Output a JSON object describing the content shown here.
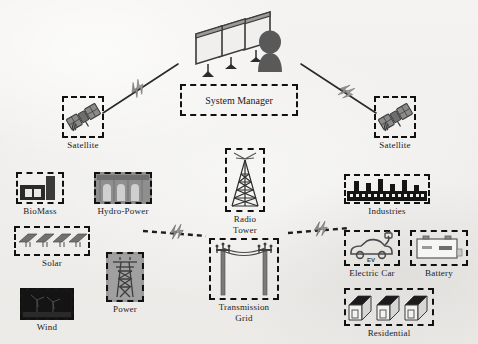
{
  "diagram": {
    "background_color": "#f2f1ef",
    "border_style": "dashed",
    "border_color": "#111111"
  },
  "nodes": {
    "system_manager": {
      "label": "System Manager",
      "icon": "monitors-operator-icon"
    },
    "satellite_left": {
      "label": "Satellite",
      "icon": "satellite-icon"
    },
    "satellite_right": {
      "label": "Satellite",
      "icon": "satellite-icon"
    },
    "biomass": {
      "label": "BioMass",
      "icon": "biomass-plant-icon"
    },
    "hydro": {
      "label": "Hydro-Power",
      "icon": "hydro-dam-icon"
    },
    "solar": {
      "label": "Solar",
      "icon": "solar-panels-icon"
    },
    "wind": {
      "label": "Wind",
      "icon": "wind-turbines-icon"
    },
    "power": {
      "label": "Power",
      "icon": "power-pylon-icon"
    },
    "radio_tower": {
      "label_line1": "Radio",
      "label_line2": "Tower",
      "icon": "radio-tower-icon"
    },
    "transmission_grid": {
      "label_line1": "Transmission",
      "label_line2": "Grid",
      "icon": "transmission-pylons-icon"
    },
    "industries": {
      "label": "Industries",
      "icon": "factories-icon"
    },
    "electric_car": {
      "label": "Electric Car",
      "icon": "electric-car-icon",
      "badge": "EV"
    },
    "battery": {
      "label": "Battery",
      "icon": "battery-icon"
    },
    "residential": {
      "label": "Residential",
      "icon": "houses-icon"
    }
  },
  "links": [
    {
      "name": "satellite-left-to-manager",
      "style": "solid-with-bolt"
    },
    {
      "name": "satellite-right-to-manager",
      "style": "solid-with-bolt"
    },
    {
      "name": "sources-to-grid",
      "style": "dashed-with-bolt"
    },
    {
      "name": "grid-to-loads",
      "style": "dashed-with-bolt"
    }
  ]
}
